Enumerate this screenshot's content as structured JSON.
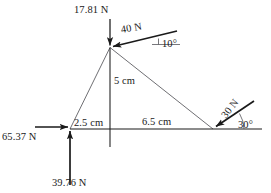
{
  "diagram": {
    "type": "free-body-force-diagram",
    "title": "",
    "units": {
      "force": "N",
      "length": "cm"
    },
    "colors": {
      "line": "#1a1a1a",
      "thin_line": "#55555a",
      "background": "#ffffff",
      "text": "#1a1a1a"
    },
    "vertices": {
      "apex": {
        "x": 110,
        "y": 47
      },
      "left": {
        "x": 70,
        "y": 129
      },
      "right": {
        "x": 213,
        "y": 129
      }
    },
    "forces": [
      {
        "id": "force-17-81",
        "label": "17.81 N",
        "magnitude": 17.81,
        "direction": "down",
        "angle_deg": 270,
        "applied_at": "apex"
      },
      {
        "id": "force-40",
        "label": "40 N",
        "magnitude": 40,
        "direction": "down-left",
        "angle_deg": 190,
        "angle_label": "10°",
        "applied_at": "apex"
      },
      {
        "id": "force-30",
        "label": "30 N",
        "magnitude": 30,
        "direction": "down-left",
        "angle_deg": 210,
        "angle_label": "30°",
        "applied_at": "right"
      },
      {
        "id": "force-65-37",
        "label": "65.37 N",
        "magnitude": 65.37,
        "direction": "right",
        "angle_deg": 0,
        "applied_at": "left"
      },
      {
        "id": "force-39-76",
        "label": "39.76 N",
        "magnitude": 39.76,
        "direction": "up",
        "angle_deg": 90,
        "applied_at": "left"
      }
    ],
    "dimensions": [
      {
        "id": "dim-2-5",
        "label": "2.5 cm",
        "value": 2.5,
        "span": "left-vertex-to-vertical"
      },
      {
        "id": "dim-6-5",
        "label": "6.5 cm",
        "value": 6.5,
        "span": "vertical-to-right-vertex"
      },
      {
        "id": "dim-5",
        "label": "5 cm",
        "value": 5,
        "span": "apex-to-baseline"
      }
    ],
    "angles": [
      {
        "id": "angle-10",
        "label": "10°",
        "value": 10
      },
      {
        "id": "angle-30",
        "label": "30°",
        "value": 30
      }
    ]
  }
}
